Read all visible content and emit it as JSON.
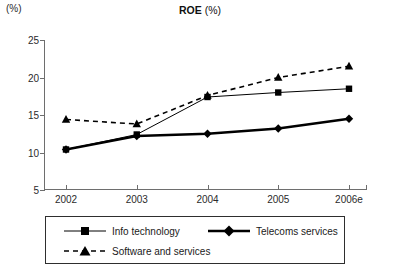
{
  "chart_data": {
    "type": "line",
    "title": "ROE (%)",
    "title_main": "ROE",
    "title_sub": "(%)",
    "xlabel": "",
    "ylabel": "(%)",
    "y_unit_label": "(%)",
    "categories": [
      "2002",
      "2003",
      "2004",
      "2005",
      "2006e"
    ],
    "ylim": [
      5,
      25
    ],
    "yticks": [
      5,
      10,
      15,
      20,
      25
    ],
    "ytick_labels": [
      "5",
      "10",
      "15",
      "20",
      "25"
    ],
    "grid": false,
    "legend_position": "below",
    "series": [
      {
        "name": "Info technology",
        "marker": "square",
        "line_style": "solid",
        "line_width": "thin",
        "color": "#000000",
        "values": [
          10.4,
          12.4,
          17.4,
          18.0,
          18.5
        ]
      },
      {
        "name": "Telecoms services",
        "marker": "diamond",
        "line_style": "solid",
        "line_width": "thick",
        "color": "#000000",
        "values": [
          10.4,
          12.2,
          12.5,
          13.2,
          14.5
        ]
      },
      {
        "name": "Software and services",
        "marker": "triangle",
        "line_style": "dashed",
        "line_width": "medium",
        "color": "#000000",
        "values": [
          14.4,
          13.8,
          17.6,
          20.0,
          21.5
        ]
      }
    ]
  },
  "legend": {
    "entries": [
      {
        "label": "Info technology"
      },
      {
        "label": "Telecoms services"
      },
      {
        "label": "Software and services"
      }
    ]
  }
}
